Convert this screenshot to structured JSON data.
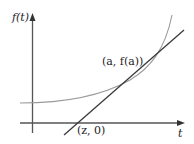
{
  "diagram": {
    "labels": {
      "y_axis": "f(t)",
      "x_axis": "t",
      "tangent_point": "(a, f(a))",
      "root_point": "(z, 0)"
    },
    "colors": {
      "axis": "#555555",
      "curve": "#9a9a9a",
      "tangent": "#3a3a3a",
      "text": "#222222"
    }
  }
}
